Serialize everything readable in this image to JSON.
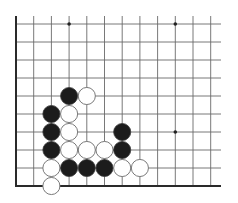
{
  "diagram": {
    "type": "go-board-fragment",
    "corner": "bottom-left",
    "grid": {
      "columns": 12,
      "rows": 10,
      "origin_x": 16,
      "origin_y": 24,
      "spacing_x": 17.7,
      "spacing_y": 18.0,
      "right_extent_x": 221,
      "top_extent_y": 16,
      "left_edge_is_board_edge": true,
      "bottom_edge_is_board_edge": true
    },
    "colors": {
      "line": "#6a6a6a",
      "edge": "#2a2a2a",
      "black_stone": "#1c1c1c",
      "white_stone": "#ffffff",
      "white_outline": "#7a7a7a",
      "background": "#ffffff"
    },
    "star_points": [
      {
        "col": 3,
        "row": 0
      },
      {
        "col": 9,
        "row": 0
      },
      {
        "col": 9,
        "row": 6
      }
    ],
    "stones": [
      {
        "col": 3,
        "row": 4,
        "color": "black"
      },
      {
        "col": 4,
        "row": 4,
        "color": "white"
      },
      {
        "col": 2,
        "row": 5,
        "color": "black"
      },
      {
        "col": 3,
        "row": 5,
        "color": "white"
      },
      {
        "col": 2,
        "row": 6,
        "color": "black"
      },
      {
        "col": 3,
        "row": 6,
        "color": "white"
      },
      {
        "col": 6,
        "row": 6,
        "color": "black"
      },
      {
        "col": 2,
        "row": 7,
        "color": "black"
      },
      {
        "col": 3,
        "row": 7,
        "color": "white"
      },
      {
        "col": 4,
        "row": 7,
        "color": "white"
      },
      {
        "col": 5,
        "row": 7,
        "color": "white"
      },
      {
        "col": 6,
        "row": 7,
        "color": "black"
      },
      {
        "col": 2,
        "row": 8,
        "color": "white"
      },
      {
        "col": 3,
        "row": 8,
        "color": "black"
      },
      {
        "col": 4,
        "row": 8,
        "color": "black"
      },
      {
        "col": 5,
        "row": 8,
        "color": "black"
      },
      {
        "col": 6,
        "row": 8,
        "color": "white"
      },
      {
        "col": 7,
        "row": 8,
        "color": "white"
      },
      {
        "col": 2,
        "row": 9,
        "color": "white"
      }
    ],
    "stone_counts": {
      "black": 9,
      "white": 10
    }
  }
}
